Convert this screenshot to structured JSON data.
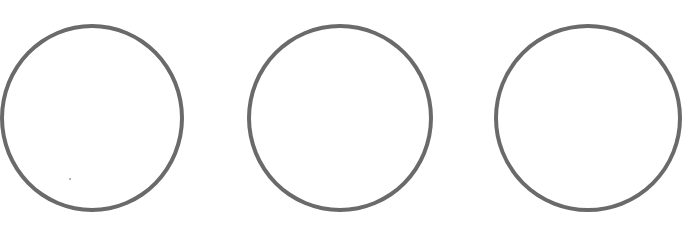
{
  "figure": {
    "background": "#ffffff",
    "stroke_color": "#6a6a6a",
    "stroke_width": 4,
    "shapes": [
      {
        "type": "circle",
        "label": "circle-1",
        "cx": 92,
        "cy": 118,
        "rx": 92,
        "ry": 94
      },
      {
        "type": "circle",
        "label": "circle-2",
        "cx": 340,
        "cy": 118,
        "rx": 93,
        "ry": 94
      },
      {
        "type": "circle",
        "label": "circle-3-partial",
        "cx": 588,
        "cy": 118,
        "rx": 94,
        "ry": 94
      }
    ],
    "specks": [
      {
        "x": 69,
        "y": 178
      }
    ]
  }
}
